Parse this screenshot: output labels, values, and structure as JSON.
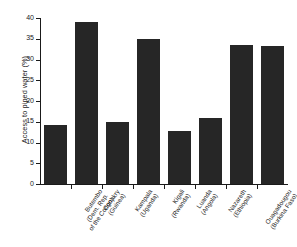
{
  "chart_data": {
    "type": "bar",
    "title": "",
    "xlabel": "",
    "ylabel": "Access to piped water (%)",
    "ylim": [
      0,
      40
    ],
    "ytick_values": [
      0,
      5,
      10,
      15,
      20,
      25,
      30,
      35,
      40
    ],
    "ytick_labels": [
      "0",
      "5",
      "10",
      "15",
      "20",
      "25",
      "30",
      "35",
      "40"
    ],
    "grid": false,
    "legend": "none",
    "bar_color": "#262626",
    "axis_color": "#1a1a1a",
    "categories": [
      "Butembo (Dem. Rep. of the Congo)",
      "Conakry (Guinea)",
      "Kampala (Uganda)",
      "Kigali (Rwanda)",
      "Luanda (Angola)",
      "Nazareth (Ethiopia)",
      "Ouagadougou (Burkina Faso)",
      "Yaounde (Cameroon)"
    ],
    "category_lines": [
      [
        "Butembo",
        "(Dem. Rep.",
        "of the Congo)"
      ],
      [
        "Conakry",
        "(Guinea)"
      ],
      [
        "Kampala",
        "(Uganda)"
      ],
      [
        "Kigali",
        "(Rwanda)"
      ],
      [
        "Luanda",
        "(Angola)"
      ],
      [
        "Nazareth",
        "(Ethiopia)"
      ],
      [
        "Ouagadougou",
        "(Burkina Faso)"
      ],
      [
        "Yaounde",
        "(Cameroon)"
      ]
    ],
    "values": [
      14.2,
      39.0,
      14.9,
      35.0,
      12.8,
      15.8,
      33.6,
      33.3
    ]
  }
}
